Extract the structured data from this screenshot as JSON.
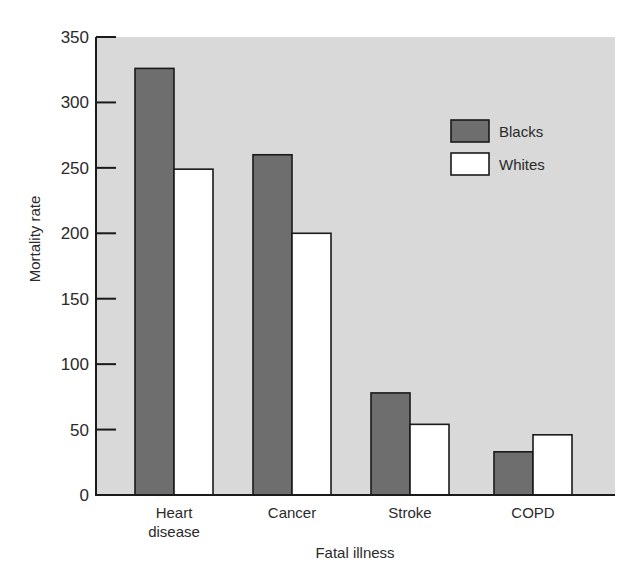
{
  "chart_data": {
    "type": "bar",
    "title": "",
    "xlabel": "Fatal illness",
    "ylabel": "Mortality rate",
    "ylim": [
      0,
      350
    ],
    "yticks": [
      0,
      50,
      100,
      150,
      200,
      250,
      300,
      350
    ],
    "categories": [
      "Heart disease",
      "Cancer",
      "Stroke",
      "COPD"
    ],
    "category_lines": [
      [
        "Heart",
        "disease"
      ],
      [
        "Cancer"
      ],
      [
        "Stroke"
      ],
      [
        "COPD"
      ]
    ],
    "series": [
      {
        "name": "Blacks",
        "color": "#6e6e6e",
        "values": [
          326,
          260,
          78,
          33
        ]
      },
      {
        "name": "Whites",
        "color": "#ffffff",
        "values": [
          249,
          200,
          54,
          46
        ]
      }
    ],
    "grid": false,
    "legend_position": "upper right (inside plot)",
    "plot_background": "#d9d9d9"
  }
}
